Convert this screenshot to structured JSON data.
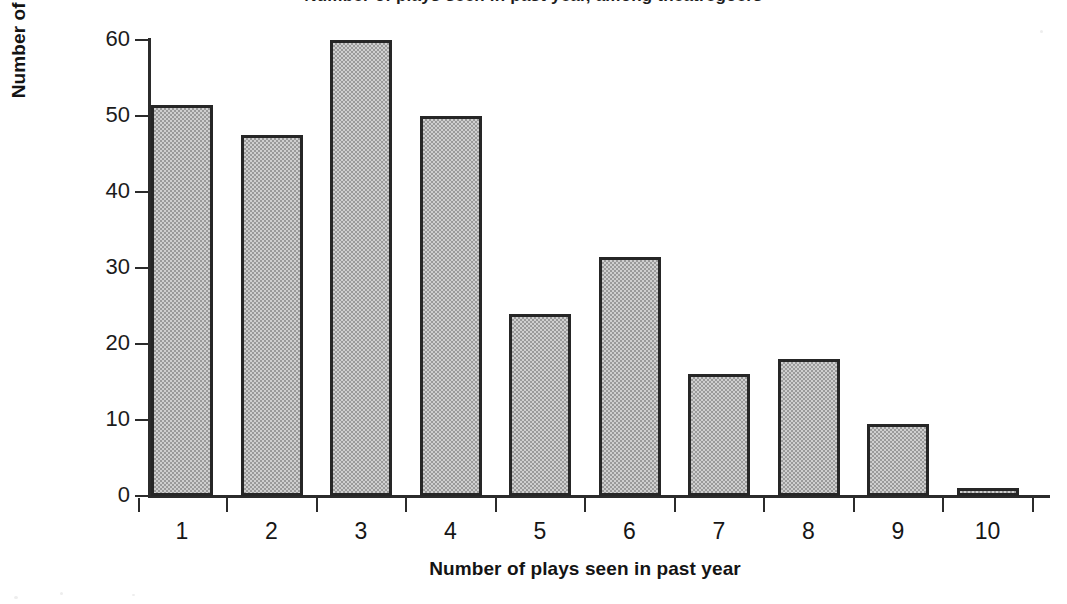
{
  "chart_data": {
    "type": "bar",
    "title": "Number of plays seen in past year",
    "xlabel": "Number of plays seen in past year",
    "ylabel": "Number of respondents",
    "categories": [
      "1",
      "2",
      "3",
      "4",
      "5",
      "6",
      "7",
      "8",
      "9",
      "10"
    ],
    "values": [
      51.5,
      47.5,
      60,
      50,
      24,
      31.5,
      16,
      18,
      9.5,
      1
    ],
    "ylim": [
      0,
      60
    ],
    "yticks": [
      0,
      10,
      20,
      30,
      40,
      50,
      60
    ],
    "ytick_labels": [
      "0",
      "10",
      "20",
      "30",
      "40",
      "50",
      "60"
    ],
    "xlim": [
      0,
      10
    ],
    "grid": false,
    "legend": null,
    "bar_fill_color": "#a8a8a8",
    "bar_edge_color": "#262626",
    "background_color": "#ffffff",
    "axis_color": "#2b2b2b"
  },
  "figure": {
    "cut_off_title": "Number of plays seen in past year, among theatregoers"
  }
}
